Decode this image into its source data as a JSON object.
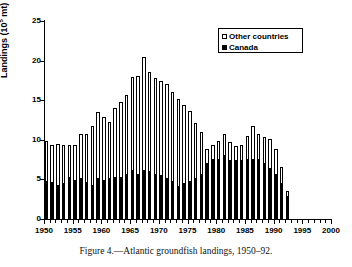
{
  "caption": "Figure 4.—Atlantic groundfish landings, 1950–92.",
  "legend": {
    "position": "top-right",
    "items": [
      {
        "label": "Other countries",
        "swatch": "open-square",
        "color": "#ffffff"
      },
      {
        "label": "Canada",
        "swatch": "filled-square",
        "color": "#000000"
      }
    ]
  },
  "axes": {
    "y_title_main": "Landings (10",
    "y_title_sup": "5",
    "y_title_tail": " mt)",
    "y_ticks": [
      "0",
      "5",
      "10",
      "15",
      "20",
      "25"
    ],
    "x_ticks": [
      "1950",
      "1955",
      "1960",
      "1965",
      "1970",
      "1975",
      "1980",
      "1985",
      "1990",
      "1995",
      "2000"
    ]
  },
  "chart_data": {
    "type": "bar",
    "subtype": "stacked",
    "title": "",
    "xlabel": "",
    "ylabel": "Landings (10^5 mt)",
    "ylim": [
      0,
      25
    ],
    "xlim": [
      1950,
      2000
    ],
    "ytick_step": 5,
    "xtick_step": 5,
    "xtick_minor_step": 1,
    "grid": false,
    "legend_position": "top-right",
    "categories": [
      1950,
      1951,
      1952,
      1953,
      1954,
      1955,
      1956,
      1957,
      1958,
      1959,
      1960,
      1961,
      1962,
      1963,
      1964,
      1965,
      1966,
      1967,
      1968,
      1969,
      1970,
      1971,
      1972,
      1973,
      1974,
      1975,
      1976,
      1977,
      1978,
      1979,
      1980,
      1981,
      1982,
      1983,
      1984,
      1985,
      1986,
      1987,
      1988,
      1989,
      1990,
      1991,
      1992
    ],
    "series": [
      {
        "name": "Canada",
        "color": "#000000",
        "values": [
          4.7,
          4.6,
          4.2,
          4.4,
          5.2,
          4.8,
          5.1,
          4.5,
          4.2,
          5.0,
          4.8,
          5.0,
          5.2,
          5.2,
          5.5,
          6.1,
          5.6,
          6.1,
          5.9,
          5.5,
          5.4,
          5.1,
          4.7,
          4.0,
          4.4,
          4.7,
          5.1,
          5.5,
          6.9,
          7.4,
          7.5,
          7.9,
          7.3,
          7.3,
          7.3,
          7.5,
          7.4,
          7.4,
          7.0,
          6.3,
          5.6,
          4.4,
          2.8
        ]
      },
      {
        "name": "Other countries",
        "color": "#ffffff",
        "values": [
          5.1,
          4.8,
          5.3,
          4.9,
          4.2,
          4.6,
          5.6,
          6.2,
          7.5,
          8.5,
          8.1,
          7.2,
          8.8,
          9.6,
          10.1,
          11.8,
          12.5,
          14.4,
          12.7,
          12.3,
          12.0,
          12.0,
          11.4,
          11.2,
          10.0,
          9.0,
          7.0,
          5.5,
          1.9,
          2.0,
          2.4,
          2.8,
          2.4,
          1.9,
          2.0,
          3.0,
          4.4,
          3.3,
          3.3,
          3.8,
          3.2,
          2.2,
          0.7
        ]
      }
    ],
    "totals": [
      9.8,
      9.4,
      9.5,
      9.3,
      9.4,
      9.4,
      10.7,
      10.7,
      11.7,
      13.5,
      12.9,
      12.2,
      14.0,
      14.8,
      15.6,
      17.9,
      18.1,
      20.5,
      18.6,
      17.8,
      17.4,
      17.1,
      16.1,
      15.2,
      14.4,
      13.7,
      12.1,
      11.0,
      8.8,
      9.4,
      9.9,
      10.7,
      9.7,
      9.2,
      9.3,
      10.5,
      11.8,
      10.7,
      10.3,
      10.1,
      8.8,
      6.6,
      3.5
    ]
  }
}
